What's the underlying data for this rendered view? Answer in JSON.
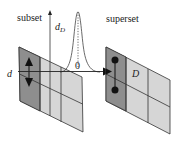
{
  "labels": {
    "subset": "subset",
    "superset": "superset",
    "d_main": "d",
    "d_sub": "D",
    "zero": "0",
    "d_left": "d",
    "D_cell": "D"
  },
  "colors": {
    "dark_cell": "#8e8e8e",
    "light_cell": "#d6d6d6",
    "stroke": "#333333",
    "background": "#ffffff"
  },
  "grid": {
    "rows": 2,
    "cols": 3,
    "left_panel": "subset grid with up/down arrows in first column",
    "right_panel": "superset grid with two dots in first column and label D in middle-top cell"
  }
}
